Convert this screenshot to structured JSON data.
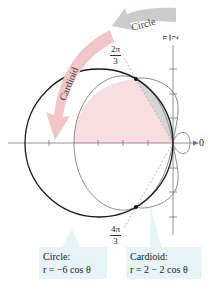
{
  "figure": {
    "axis_labels": {
      "polar_axis": "0",
      "pi_over_2": {
        "num": "π",
        "den": "2"
      }
    },
    "angle_labels": {
      "two_pi_over_3": {
        "num": "2π",
        "den": "3"
      },
      "four_pi_over_3": {
        "num": "4π",
        "den": "3"
      }
    },
    "arrows": {
      "circle": "Circle",
      "cardioid": "Cardioid"
    },
    "callouts": {
      "circle": {
        "title": "Circle:",
        "equation": "r = −6 cos θ"
      },
      "cardioid": {
        "title": "Cardioid:",
        "equation": "r = 2 − 2 cos θ"
      }
    },
    "colors": {
      "circle_stroke": "#1a1a1a",
      "cardioid_stroke": "#8a8a8a",
      "shaded_region": "#f7dde0",
      "gray_region": "#d3d6d8",
      "arrow_pink": "#f2c6c6",
      "arrow_gray": "#c9cccc",
      "callout_bg": "#e6f4f8"
    }
  }
}
